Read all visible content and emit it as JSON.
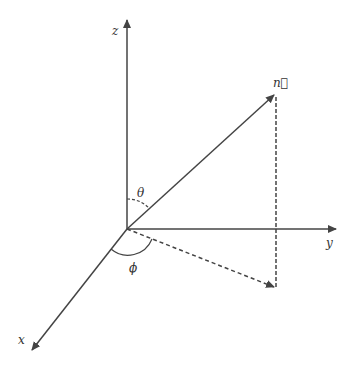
{
  "diagram": {
    "type": "3d-coordinate-system-spherical-angles",
    "colors": {
      "line": "#444444",
      "background": "#ffffff"
    },
    "origin": [
      127,
      229
    ],
    "axes": [
      {
        "name": "z",
        "label": "z",
        "tip": [
          127,
          18
        ]
      },
      {
        "name": "y",
        "label": "y",
        "tip": [
          338,
          229
        ]
      },
      {
        "name": "x",
        "label": "x",
        "tip": [
          30,
          352
        ]
      }
    ],
    "vector": {
      "label": "n⃗",
      "tip": [
        276,
        93
      ]
    },
    "projection": {
      "tip": [
        276,
        289
      ],
      "style": "dashed"
    },
    "angles": [
      {
        "name": "theta",
        "label": "θ",
        "between": [
          "z-axis",
          "n-vector"
        ]
      },
      {
        "name": "phi",
        "label": "ϕ",
        "between": [
          "x-axis",
          "projection"
        ]
      }
    ]
  }
}
